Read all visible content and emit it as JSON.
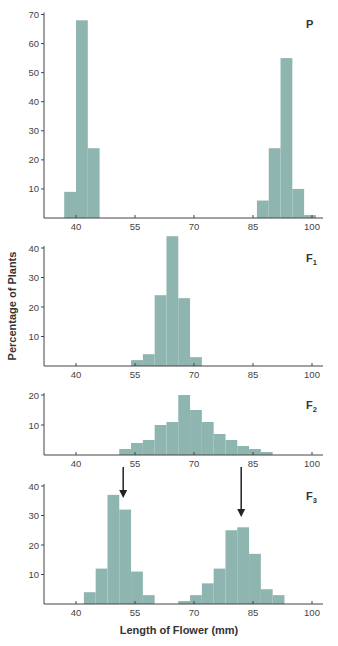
{
  "chart_data": {
    "type": "bar",
    "title": "",
    "xlabel": "Length of Flower (mm)",
    "ylabel": "Percentage of Plants",
    "x_ticks": [
      40,
      55,
      70,
      85,
      100
    ],
    "bar_color": "#8fb5b0",
    "panels": [
      {
        "label": "P",
        "ylim": [
          0,
          70
        ],
        "y_ticks": [
          10,
          20,
          30,
          40,
          50,
          60,
          70
        ],
        "bins": [
          {
            "x0": 37,
            "x1": 40,
            "value": 9
          },
          {
            "x0": 40,
            "x1": 43,
            "value": 68
          },
          {
            "x0": 43,
            "x1": 46,
            "value": 24
          },
          {
            "x0": 86,
            "x1": 89,
            "value": 6
          },
          {
            "x0": 89,
            "x1": 92,
            "value": 24
          },
          {
            "x0": 92,
            "x1": 95,
            "value": 55
          },
          {
            "x0": 95,
            "x1": 98,
            "value": 10
          },
          {
            "x0": 98,
            "x1": 101,
            "value": 1
          }
        ]
      },
      {
        "label": "F1",
        "ylim": [
          0,
          44
        ],
        "y_ticks": [
          10,
          20,
          30,
          40
        ],
        "bins": [
          {
            "x0": 54,
            "x1": 57,
            "value": 2
          },
          {
            "x0": 57,
            "x1": 60,
            "value": 4
          },
          {
            "x0": 60,
            "x1": 63,
            "value": 24
          },
          {
            "x0": 63,
            "x1": 66,
            "value": 44
          },
          {
            "x0": 66,
            "x1": 69,
            "value": 23
          },
          {
            "x0": 69,
            "x1": 72,
            "value": 3
          }
        ]
      },
      {
        "label": "F2",
        "ylim": [
          0,
          20
        ],
        "y_ticks": [
          10,
          20
        ],
        "bins": [
          {
            "x0": 51,
            "x1": 54,
            "value": 2
          },
          {
            "x0": 54,
            "x1": 57,
            "value": 4
          },
          {
            "x0": 57,
            "x1": 60,
            "value": 5
          },
          {
            "x0": 60,
            "x1": 63,
            "value": 10
          },
          {
            "x0": 63,
            "x1": 66,
            "value": 11
          },
          {
            "x0": 66,
            "x1": 69,
            "value": 20
          },
          {
            "x0": 69,
            "x1": 72,
            "value": 15
          },
          {
            "x0": 72,
            "x1": 75,
            "value": 11
          },
          {
            "x0": 75,
            "x1": 78,
            "value": 7
          },
          {
            "x0": 78,
            "x1": 81,
            "value": 5
          },
          {
            "x0": 81,
            "x1": 84,
            "value": 3
          },
          {
            "x0": 84,
            "x1": 87,
            "value": 2
          },
          {
            "x0": 87,
            "x1": 90,
            "value": 1
          }
        ]
      },
      {
        "label": "F3",
        "ylim": [
          0,
          40
        ],
        "y_ticks": [
          10,
          20,
          30,
          40
        ],
        "bins": [
          {
            "x0": 42,
            "x1": 45,
            "value": 4
          },
          {
            "x0": 45,
            "x1": 48,
            "value": 12
          },
          {
            "x0": 48,
            "x1": 51,
            "value": 37
          },
          {
            "x0": 51,
            "x1": 54,
            "value": 32
          },
          {
            "x0": 54,
            "x1": 57,
            "value": 11
          },
          {
            "x0": 57,
            "x1": 60,
            "value": 3
          },
          {
            "x0": 66,
            "x1": 69,
            "value": 1
          },
          {
            "x0": 69,
            "x1": 72,
            "value": 3
          },
          {
            "x0": 72,
            "x1": 75,
            "value": 7
          },
          {
            "x0": 75,
            "x1": 78,
            "value": 12
          },
          {
            "x0": 78,
            "x1": 81,
            "value": 25
          },
          {
            "x0": 81,
            "x1": 84,
            "value": 26
          },
          {
            "x0": 84,
            "x1": 87,
            "value": 17
          },
          {
            "x0": 87,
            "x1": 90,
            "value": 5
          },
          {
            "x0": 90,
            "x1": 93,
            "value": 3
          }
        ]
      }
    ],
    "annotations": [
      {
        "type": "arrow",
        "from_panel": "F2",
        "to_panel": "F3",
        "x": 52
      },
      {
        "type": "arrow",
        "from_panel": "F2",
        "to_panel": "F3",
        "x": 82
      }
    ]
  },
  "labels": {
    "ylabel": "Percentage of Plants",
    "xlabel": "Length of Flower (mm)"
  }
}
